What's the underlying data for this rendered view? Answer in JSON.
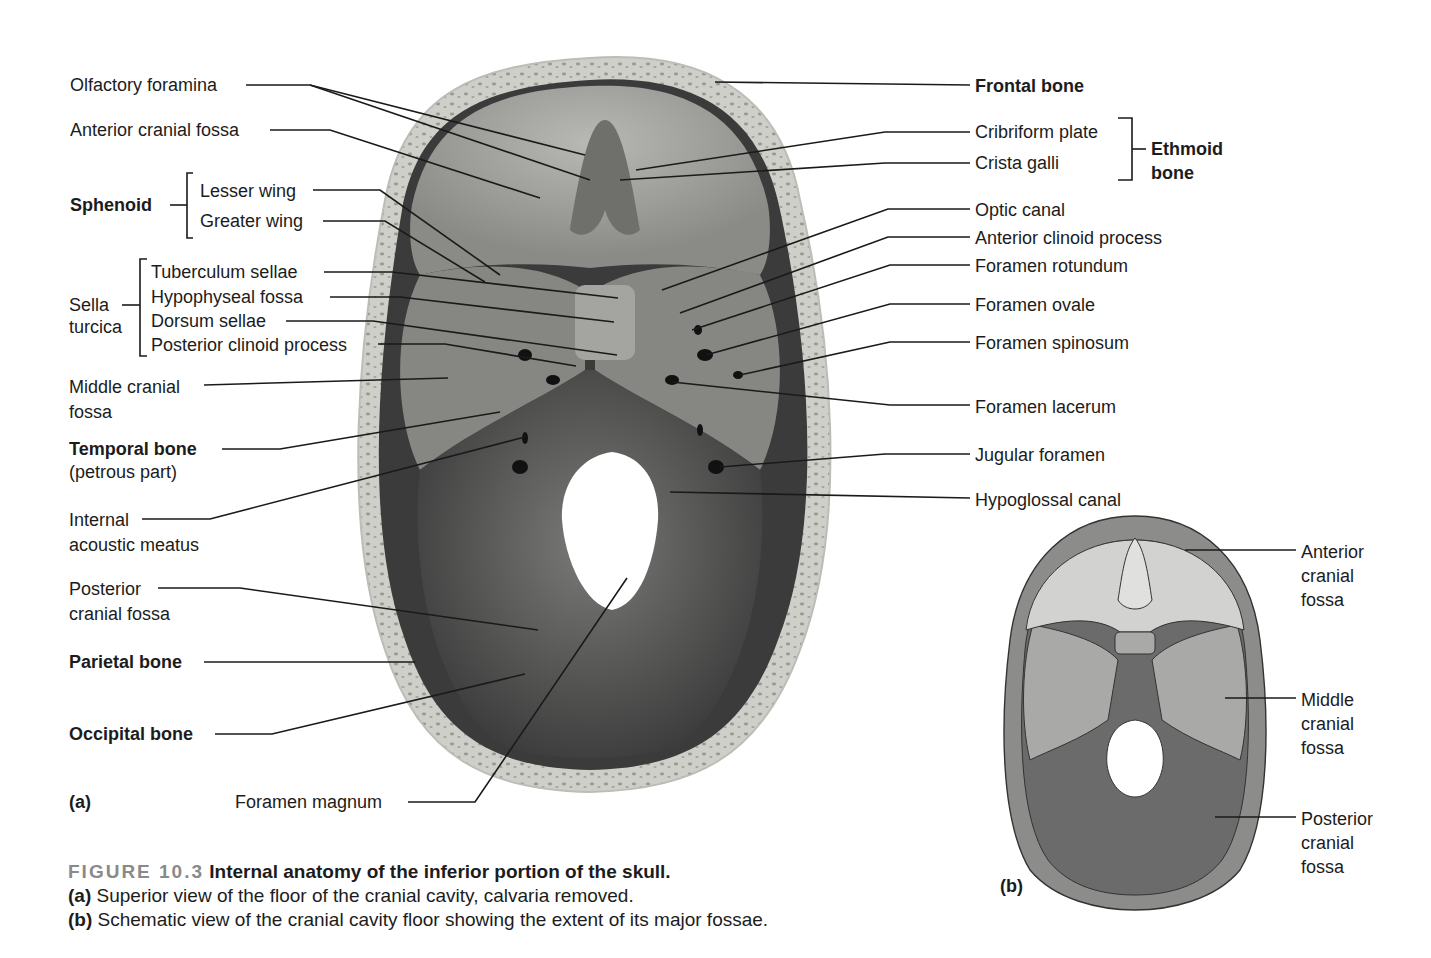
{
  "figure": {
    "number": "FIGURE 10.3",
    "title": "Internal anatomy of the inferior portion of the skull.",
    "caption_a_tag": "(a)",
    "caption_a": "Superior view of the floor of the cranial cavity, calvaria removed.",
    "caption_b_tag": "(b)",
    "caption_b": "Schematic view of the cranial cavity floor showing the extent of its major fossae."
  },
  "panel_a": {
    "tag": "(a)",
    "left_labels": [
      {
        "text": "Olfactory foramina",
        "bold": false
      },
      {
        "text": "Anterior cranial fossa",
        "bold": false
      },
      {
        "text": "Sphenoid",
        "bold": true
      },
      {
        "text": "Lesser wing",
        "bold": false
      },
      {
        "text": "Greater wing",
        "bold": false
      },
      {
        "text": "Sella\nturcica",
        "bold": false
      },
      {
        "text": "Tuberculum sellae",
        "bold": false
      },
      {
        "text": "Hypophyseal fossa",
        "bold": false
      },
      {
        "text": "Dorsum sellae",
        "bold": false
      },
      {
        "text": "Posterior clinoid process",
        "bold": false
      },
      {
        "text": "Middle cranial\nfossa",
        "bold": false
      },
      {
        "text": "Temporal bone",
        "bold": true
      },
      {
        "text": "(petrous part)",
        "bold": false
      },
      {
        "text": "Internal\nacoustic meatus",
        "bold": false
      },
      {
        "text": "Posterior\ncranial fossa",
        "bold": false
      },
      {
        "text": "Parietal bone",
        "bold": true
      },
      {
        "text": "Occipital bone",
        "bold": true
      },
      {
        "text": "Foramen magnum",
        "bold": false
      }
    ],
    "right_labels": [
      {
        "text": "Frontal bone",
        "bold": true
      },
      {
        "text": "Cribriform plate",
        "bold": false
      },
      {
        "text": "Crista galli",
        "bold": false
      },
      {
        "text": "Ethmoid\nbone",
        "bold": true
      },
      {
        "text": "Optic canal",
        "bold": false
      },
      {
        "text": "Anterior clinoid process",
        "bold": false
      },
      {
        "text": "Foramen rotundum",
        "bold": false
      },
      {
        "text": "Foramen ovale",
        "bold": false
      },
      {
        "text": "Foramen spinosum",
        "bold": false
      },
      {
        "text": "Foramen lacerum",
        "bold": false
      },
      {
        "text": "Jugular foramen",
        "bold": false
      },
      {
        "text": "Hypoglossal canal",
        "bold": false
      }
    ]
  },
  "panel_b": {
    "tag": "(b)",
    "labels": [
      {
        "text": "Anterior\ncranial\nfossa"
      },
      {
        "text": "Middle\ncranial\nfossa"
      },
      {
        "text": "Posterior\ncranial\nfossa"
      }
    ]
  },
  "colors": {
    "bone_rim": "#c9c9c3",
    "anterior_fossa": "#8f8f8c",
    "middle_fossa": "#7a7a78",
    "posterior_fossa": "#4e4e4e",
    "schematic_anterior": "#d2d2d0",
    "schematic_middle": "#a9a9a7",
    "schematic_posterior": "#6b6b6b",
    "schematic_rim": "#8c8c8a",
    "figure_number": "#8a8a8a"
  }
}
